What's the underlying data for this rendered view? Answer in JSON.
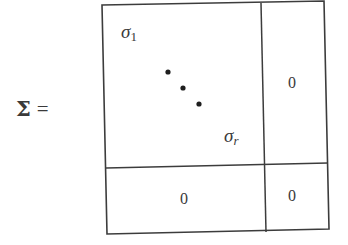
{
  "equation": {
    "lhs_symbol": "Σ",
    "equals": "="
  },
  "matrix": {
    "blocks": {
      "top_left": {
        "first_entry": {
          "base": "σ",
          "subscript": "1"
        },
        "ellipsis": "diagonal dots (3)",
        "last_entry": {
          "base": "σ",
          "subscript": "r"
        }
      },
      "top_right": "0",
      "bottom_left": "0",
      "bottom_right": "0"
    },
    "geometry": {
      "outer": {
        "tl": [
          102,
          5
        ],
        "tr": [
          324,
          1
        ],
        "br": [
          329,
          229
        ],
        "bl": [
          107,
          234
        ]
      },
      "vertical_divider": {
        "top": [
          261,
          3
        ],
        "bottom": [
          266,
          232
        ]
      },
      "horizontal_divider": {
        "left": [
          106,
          168
        ],
        "right": [
          328,
          163
        ]
      },
      "dots": [
        [
          168,
          72
        ],
        [
          183,
          88
        ],
        [
          199,
          104
        ]
      ]
    },
    "colors": {
      "line": "#3c3c3c",
      "text": "#3a3a3a",
      "background": "#ffffff"
    }
  }
}
